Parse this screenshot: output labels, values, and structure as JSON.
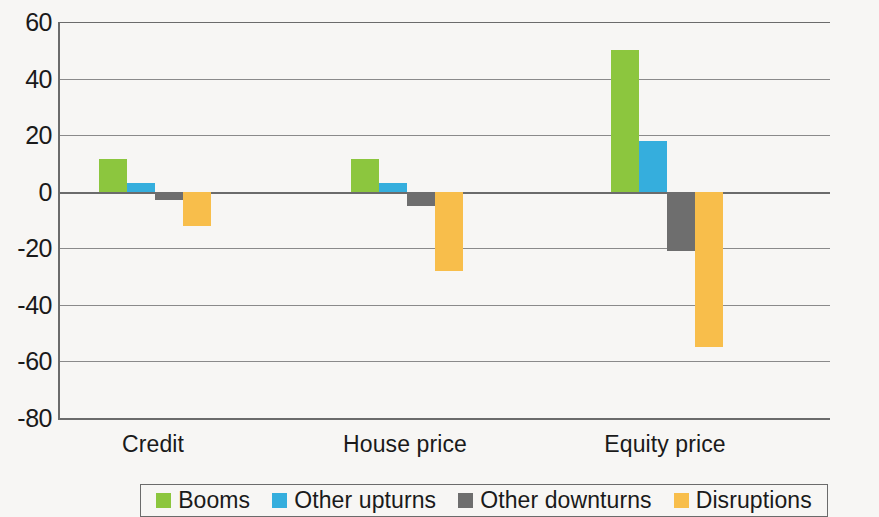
{
  "chart_data": {
    "type": "bar",
    "title": "",
    "subtitle": "",
    "xlabel": "",
    "ylabel": "",
    "categories": [
      "Credit",
      "House price",
      "Equity price"
    ],
    "series": [
      {
        "name": "Booms",
        "color": "#8CC63E",
        "values": [
          11.5,
          11.5,
          50
        ]
      },
      {
        "name": "Other upturns",
        "color": "#35AEDD",
        "values": [
          3,
          3,
          18
        ]
      },
      {
        "name": "Other downturns",
        "color": "#6E6E6E",
        "values": [
          -3,
          -5,
          -21
        ]
      },
      {
        "name": "Disruptions",
        "color": "#F8BE4B",
        "values": [
          -12,
          -28,
          -55
        ]
      }
    ],
    "ylim": [
      -80,
      60
    ],
    "ytick_values": [
      60,
      40,
      20,
      0,
      -20,
      -40,
      -60,
      -80
    ],
    "ytick_labels": [
      "60",
      "40",
      "20",
      "0",
      "-20",
      "-40",
      "-60",
      "-80"
    ],
    "grid": true,
    "legend_position": "bottom",
    "annotations": []
  },
  "colors": {
    "background": "#f7f6f4",
    "axis": "#6b6b6b",
    "gridline": "#8a8a8a",
    "text": "#1a1a1a"
  }
}
